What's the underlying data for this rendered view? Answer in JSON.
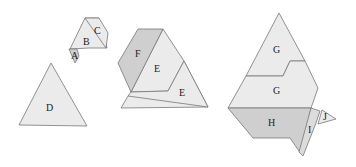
{
  "figure": {
    "groups": [
      {
        "name": "group-abc",
        "pieces": [
          {
            "label": "A",
            "shade": "dark"
          },
          {
            "label": "B",
            "shade": "light"
          },
          {
            "label": "C",
            "shade": "light"
          }
        ]
      },
      {
        "name": "group-d",
        "pieces": [
          {
            "label": "D",
            "shade": "light"
          }
        ]
      },
      {
        "name": "group-fee",
        "pieces": [
          {
            "label": "F",
            "shade": "dark"
          },
          {
            "label": "E",
            "shade": "light"
          },
          {
            "label": "E",
            "shade": "light"
          }
        ]
      },
      {
        "name": "group-gghij",
        "pieces": [
          {
            "label": "G",
            "shade": "light"
          },
          {
            "label": "G",
            "shade": "light"
          },
          {
            "label": "H",
            "shade": "dark"
          },
          {
            "label": "I",
            "shade": "dark"
          },
          {
            "label": "J",
            "shade": "light"
          }
        ]
      }
    ]
  },
  "labels": {
    "a": "A",
    "b": "B",
    "c": "C",
    "d": "D",
    "e1": "E",
    "e2": "E",
    "f": "F",
    "g1": "G",
    "g2": "G",
    "h": "H",
    "i": "I",
    "j": "J"
  }
}
